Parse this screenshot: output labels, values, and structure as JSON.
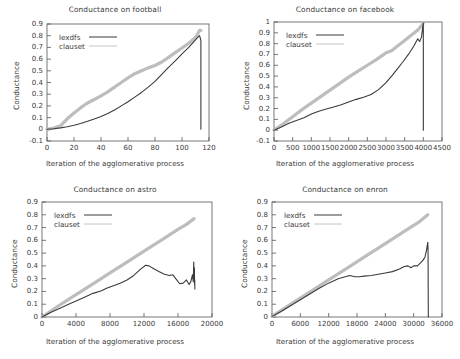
{
  "figure": {
    "kind": "multi-panel-line-chart",
    "panel_count": 4,
    "shared_xlabel": "Iteration of the agglomerative process",
    "shared_ylabel": "Conductance",
    "series_names": [
      "lexdfs",
      "clauset"
    ],
    "colors": {
      "lexdfs": "#3b3b3b",
      "clauset": "#bdbdbd",
      "axis": "#555555",
      "text": "#3a3a3a"
    }
  },
  "chart_data": [
    {
      "type": "line",
      "title": "Conductance on football",
      "xlabel": "Iteration of the agglomerative process",
      "ylabel": "Conductance",
      "xlim": [
        0,
        120
      ],
      "ylim": [
        -0.1,
        0.9
      ],
      "xticks": [
        0,
        20,
        40,
        60,
        80,
        100,
        120
      ],
      "yticks": [
        -0.1,
        0,
        0.1,
        0.2,
        0.3,
        0.4,
        0.5,
        0.6,
        0.7,
        0.8,
        0.9
      ],
      "grid": false,
      "legend": [
        "lexdfs",
        "clauset"
      ],
      "legend_position": "top-left",
      "series": [
        {
          "name": "lexdfs",
          "x": [
            0,
            5,
            10,
            15,
            20,
            25,
            30,
            35,
            40,
            45,
            50,
            55,
            60,
            65,
            70,
            75,
            80,
            85,
            90,
            95,
            100,
            105,
            110,
            112,
            113,
            114,
            114
          ],
          "y": [
            0.0,
            0.005,
            0.012,
            0.022,
            0.035,
            0.05,
            0.068,
            0.088,
            0.11,
            0.135,
            0.165,
            0.2,
            0.235,
            0.275,
            0.315,
            0.36,
            0.41,
            0.47,
            0.53,
            0.585,
            0.645,
            0.7,
            0.765,
            0.79,
            0.8,
            0.76,
            0.0
          ]
        },
        {
          "name": "clauset",
          "x": [
            0,
            5,
            10,
            15,
            20,
            25,
            30,
            35,
            40,
            45,
            50,
            55,
            60,
            65,
            70,
            75,
            80,
            85,
            90,
            95,
            100,
            105,
            110,
            113,
            114
          ],
          "y": [
            0.0,
            0.01,
            0.03,
            0.09,
            0.14,
            0.185,
            0.225,
            0.255,
            0.285,
            0.32,
            0.36,
            0.4,
            0.44,
            0.475,
            0.5,
            0.525,
            0.545,
            0.575,
            0.615,
            0.655,
            0.695,
            0.735,
            0.785,
            0.845,
            0.845
          ]
        }
      ]
    },
    {
      "type": "line",
      "title": "Conductance on facebook",
      "xlabel": "Iteration of the agglomerative process",
      "ylabel": "Conductance",
      "xlim": [
        0,
        4500
      ],
      "ylim": [
        -0.1,
        1.0
      ],
      "xticks": [
        0,
        500,
        1000,
        1500,
        2000,
        2500,
        3000,
        3500,
        4000,
        4500
      ],
      "yticks": [
        -0.1,
        0,
        0.1,
        0.2,
        0.3,
        0.4,
        0.5,
        0.6,
        0.7,
        0.8,
        0.9,
        1.0
      ],
      "grid": false,
      "legend": [
        "lexdfs",
        "clauset"
      ],
      "legend_position": "top-left",
      "series": [
        {
          "name": "lexdfs",
          "x": [
            0,
            200,
            400,
            600,
            800,
            1000,
            1200,
            1400,
            1600,
            1800,
            2000,
            2200,
            2400,
            2600,
            2800,
            3000,
            3150,
            3300,
            3450,
            3600,
            3750,
            3850,
            3900,
            3950,
            3990,
            4000,
            4000
          ],
          "y": [
            0.0,
            0.03,
            0.065,
            0.09,
            0.115,
            0.15,
            0.175,
            0.195,
            0.215,
            0.235,
            0.26,
            0.285,
            0.305,
            0.33,
            0.375,
            0.44,
            0.5,
            0.565,
            0.63,
            0.7,
            0.78,
            0.845,
            0.82,
            0.86,
            0.97,
            0.99,
            0.0
          ]
        },
        {
          "name": "clauset",
          "x": [
            0,
            250,
            500,
            750,
            1000,
            1250,
            1500,
            1750,
            2000,
            2250,
            2500,
            2750,
            3000,
            3150,
            3300,
            3500,
            3700,
            3850,
            3950,
            4000
          ],
          "y": [
            0.0,
            0.06,
            0.125,
            0.19,
            0.25,
            0.31,
            0.37,
            0.43,
            0.49,
            0.545,
            0.6,
            0.655,
            0.715,
            0.735,
            0.775,
            0.83,
            0.885,
            0.925,
            0.965,
            0.99
          ]
        }
      ]
    },
    {
      "type": "line",
      "title": "Conductance on astro",
      "xlabel": "Iteration of the agglomerative process",
      "ylabel": "Conductance",
      "xlim": [
        0,
        20000
      ],
      "ylim": [
        0,
        0.9
      ],
      "xticks": [
        0,
        4000,
        8000,
        12000,
        16000,
        20000
      ],
      "yticks": [
        0,
        0.1,
        0.2,
        0.3,
        0.4,
        0.5,
        0.6,
        0.7,
        0.8,
        0.9
      ],
      "grid": false,
      "legend": [
        "lexdfs",
        "clauset"
      ],
      "legend_position": "top-left",
      "series": [
        {
          "name": "lexdfs",
          "x": [
            0,
            1000,
            2000,
            3000,
            4000,
            5000,
            6000,
            7000,
            7600,
            8400,
            9200,
            10000,
            10800,
            11600,
            12200,
            12600,
            13200,
            13800,
            14400,
            15000,
            15400,
            15800,
            16200,
            16600,
            17000,
            17300,
            17500,
            17700,
            17800,
            17850,
            17900,
            17930,
            17950,
            17970,
            17980
          ],
          "y": [
            0.0,
            0.035,
            0.065,
            0.095,
            0.125,
            0.155,
            0.185,
            0.205,
            0.225,
            0.245,
            0.265,
            0.29,
            0.325,
            0.375,
            0.405,
            0.4,
            0.375,
            0.355,
            0.335,
            0.325,
            0.33,
            0.295,
            0.26,
            0.265,
            0.29,
            0.255,
            0.275,
            0.33,
            0.275,
            0.43,
            0.3,
            0.385,
            0.255,
            0.29,
            0.22
          ]
        },
        {
          "name": "clauset",
          "x": [
            0,
            2000,
            4000,
            6000,
            8000,
            10000,
            12000,
            14000,
            16000,
            17000,
            17900
          ],
          "y": [
            0.0,
            0.09,
            0.175,
            0.26,
            0.345,
            0.43,
            0.515,
            0.6,
            0.685,
            0.725,
            0.77
          ]
        }
      ]
    },
    {
      "type": "line",
      "title": "Conductance on enron",
      "xlabel": "Iteration of the agglomerative process",
      "ylabel": "Conductance",
      "xlim": [
        0,
        36000
      ],
      "ylim": [
        0,
        0.9
      ],
      "xticks": [
        0,
        6000,
        12000,
        18000,
        24000,
        30000,
        36000
      ],
      "yticks": [
        0,
        0.1,
        0.2,
        0.3,
        0.4,
        0.5,
        0.6,
        0.7,
        0.8,
        0.9
      ],
      "grid": false,
      "legend": [
        "lexdfs",
        "clauset"
      ],
      "legend_position": "top-left",
      "series": [
        {
          "name": "lexdfs",
          "x": [
            0,
            2000,
            4000,
            6000,
            8000,
            10000,
            12000,
            14000,
            15500,
            16500,
            17500,
            18500,
            19500,
            21000,
            22500,
            24000,
            25500,
            27000,
            28000,
            28800,
            29400,
            30000,
            30800,
            31500,
            32000,
            32400,
            32700,
            32900,
            33000,
            33050,
            33080,
            33100,
            33100
          ],
          "y": [
            0.005,
            0.045,
            0.09,
            0.135,
            0.18,
            0.225,
            0.265,
            0.3,
            0.315,
            0.325,
            0.315,
            0.315,
            0.32,
            0.325,
            0.335,
            0.345,
            0.355,
            0.375,
            0.395,
            0.4,
            0.385,
            0.4,
            0.4,
            0.425,
            0.445,
            0.47,
            0.52,
            0.565,
            0.585,
            0.5,
            0.19,
            0.06,
            0.0
          ]
        },
        {
          "name": "clauset",
          "x": [
            0,
            4000,
            8000,
            12000,
            16000,
            20000,
            24000,
            28000,
            31000,
            33000
          ],
          "y": [
            0.005,
            0.1,
            0.195,
            0.29,
            0.385,
            0.48,
            0.575,
            0.67,
            0.74,
            0.8
          ]
        }
      ]
    }
  ]
}
